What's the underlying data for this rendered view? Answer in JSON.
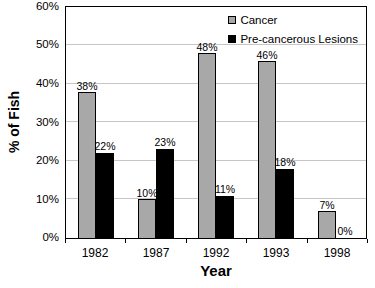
{
  "figure": {
    "background": "#ffffff"
  },
  "chart_data": {
    "type": "bar",
    "title": "",
    "xlabel": "Year",
    "ylabel": "% of Fish",
    "categories": [
      "1982",
      "1987",
      "1992",
      "1993",
      "1998"
    ],
    "series": [
      {
        "name": "Cancer",
        "color": "#a8a8a8",
        "values": [
          38,
          10,
          48,
          46,
          7
        ]
      },
      {
        "name": "Pre-cancerous Lesions",
        "color": "#000000",
        "values": [
          22,
          23,
          11,
          18,
          0
        ]
      }
    ],
    "ylim": [
      0,
      60
    ],
    "y_tick_step": 10,
    "y_tick_labels": [
      "0%",
      "10%",
      "20%",
      "30%",
      "40%",
      "50%",
      "60%"
    ],
    "grid": true,
    "gridline_color": "#c6c6c6",
    "axis_color": "#000000",
    "legend_position": "top-right-inside",
    "data_label_suffix": "%"
  }
}
